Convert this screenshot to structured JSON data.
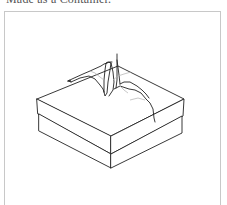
{
  "document": {
    "caption_clipped": "Made as a Container."
  },
  "figure": {
    "style": "black line drawing on white",
    "frame_color": "#c8c8c8",
    "line_color": "#222222",
    "shade_line_color": "#b0b0b0"
  }
}
